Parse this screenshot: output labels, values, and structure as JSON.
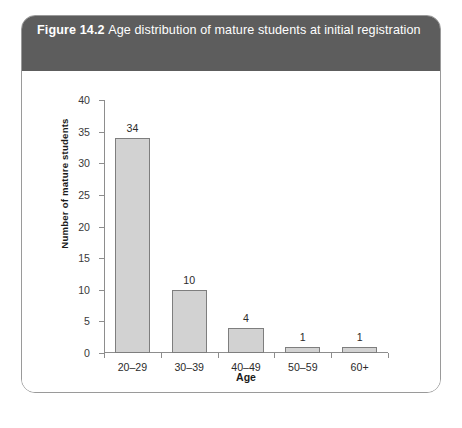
{
  "figure": {
    "number_label": "Figure 14.2",
    "caption": "Age distribution of mature students at initial registration",
    "frame_color": "#9a9a9a",
    "caption_band_color": "#5d5d5d",
    "caption_text_color": "#ffffff"
  },
  "chart_data": {
    "type": "bar",
    "title": "Age distribution of mature students at initial registration",
    "xlabel": "Age",
    "ylabel": "Number of mature students",
    "categories": [
      "20–29",
      "30–39",
      "40–49",
      "50–59",
      "60+"
    ],
    "values": [
      34,
      10,
      4,
      1,
      1
    ],
    "data_labels": [
      "34",
      "10",
      "4",
      "1",
      "1"
    ],
    "ylim": [
      0,
      40
    ],
    "ytick_step": 5,
    "ytick_labels": [
      "0",
      "5",
      "10",
      "15",
      "20",
      "25",
      "30",
      "35",
      "40"
    ],
    "ytick_values": [
      0,
      5,
      10,
      15,
      20,
      25,
      30,
      35,
      40
    ],
    "grid": false,
    "legend": null,
    "bar_fill_color": "#d2d2d2",
    "bar_border_color": "#7e7e7e",
    "axis_color": "#8d8d8d"
  }
}
